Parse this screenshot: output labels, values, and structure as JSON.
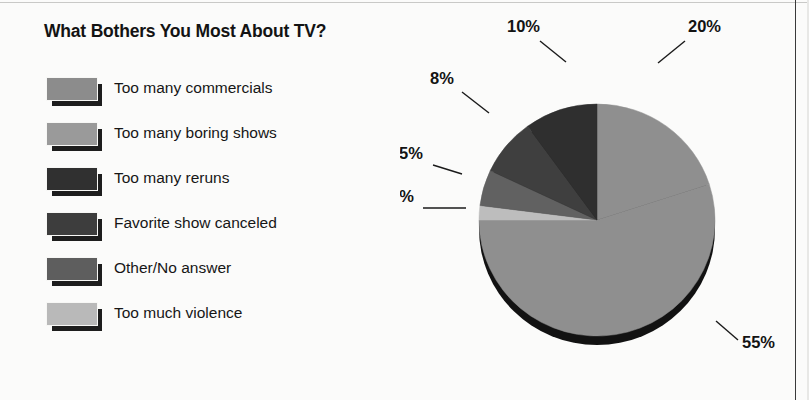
{
  "title": "What Bothers You Most About TV?",
  "legend": {
    "items": [
      {
        "label": "Too many commercials",
        "color": "#8c8c8c"
      },
      {
        "label": "Too many boring shows",
        "color": "#9a9a9a"
      },
      {
        "label": "Too many reruns",
        "color": "#303030"
      },
      {
        "label": "Favorite show canceled",
        "color": "#3d3d3d"
      },
      {
        "label": "Other/No answer",
        "color": "#5e5e5e"
      },
      {
        "label": "Too much violence",
        "color": "#b9b9b9"
      }
    ]
  },
  "chart_data": {
    "type": "pie",
    "title": "What Bothers You Most About TV?",
    "unit": "%",
    "legend_position": "left",
    "start_angle_deg": 0,
    "direction": "clockwise",
    "categories": [
      "Too many commercials",
      "Too many boring shows",
      "Too many reruns",
      "Favorite show canceled",
      "Other/No answer",
      "Too much violence"
    ],
    "values": [
      55,
      20,
      10,
      8,
      5,
      2
    ],
    "slices": [
      {
        "label": "20%",
        "value": 20,
        "category": "Too many boring shows",
        "color": "#8f8f8f"
      },
      {
        "label": "55%",
        "value": 55,
        "category": "Too many commercials",
        "color": "#8f8f8f"
      },
      {
        "label": "2%",
        "value": 2,
        "category": "Too much violence",
        "color": "#bdbdbd"
      },
      {
        "label": "5%",
        "value": 5,
        "category": "Other/No answer",
        "color": "#616161"
      },
      {
        "label": "8%",
        "value": 8,
        "category": "Favorite show canceled",
        "color": "#3f3f3f"
      },
      {
        "label": "10%",
        "value": 10,
        "category": "Too many reruns",
        "color": "#2f2f2f"
      }
    ],
    "labels": [
      "10%",
      "20%",
      "8%",
      "5%",
      "2%",
      "55%"
    ],
    "total": 100,
    "grid": false
  }
}
